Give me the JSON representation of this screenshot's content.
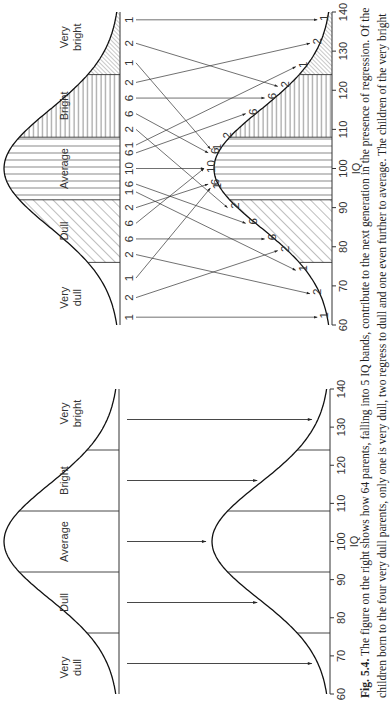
{
  "figure": {
    "number_label": "Fig. 5.4.",
    "caption_line1": "The figure on the right shows how 64 parents, falling into 5 IQ bands, contribute to the next generation in the presence of regression. Of the",
    "caption_line2": "children born to the four very dull parents, only one is very dull, two regress to dull and one even further to average. The children of the very bright"
  },
  "axis": {
    "label": "IQ",
    "ticks": [
      60,
      70,
      80,
      90,
      100,
      110,
      120,
      130,
      140
    ]
  },
  "bands": [
    {
      "name": "Very dull",
      "lines": [
        "Very",
        "dull"
      ],
      "from": 60,
      "to": 76
    },
    {
      "name": "Dull",
      "lines": [
        "Dull"
      ],
      "from": 76,
      "to": 92
    },
    {
      "name": "Average",
      "lines": [
        "Average"
      ],
      "from": 92,
      "to": 108
    },
    {
      "name": "Bright",
      "lines": [
        "Bright"
      ],
      "from": 108,
      "to": 124
    },
    {
      "name": "Very bright",
      "lines": [
        "Very",
        "bright"
      ],
      "from": 124,
      "to": 140
    }
  ],
  "colors": {
    "ink": "#333333",
    "paper": "#ffffff"
  },
  "chart_data": [
    {
      "type": "diagram",
      "title": "Left figure: regression-free inheritance",
      "xlabel": "IQ",
      "xlim": [
        60,
        140
      ],
      "categories": [
        "Very dull",
        "Dull",
        "Average",
        "Bright",
        "Very bright"
      ],
      "band_boundaries": [
        76,
        92,
        108,
        124
      ],
      "parent_positions": [
        68,
        84,
        100,
        116,
        132
      ],
      "child_positions": [
        68,
        84,
        100,
        116,
        132
      ],
      "note": "Each parent band maps straight down to the same IQ in the next generation"
    },
    {
      "type": "diagram",
      "title": "Right figure: 64 parents contributing to next generation with regression",
      "xlabel": "IQ",
      "xlim": [
        60,
        140
      ],
      "categories": [
        "Very dull",
        "Dull",
        "Average",
        "Bright",
        "Very bright"
      ],
      "parent_counts_by_band": [
        4,
        16,
        24,
        16,
        4
      ],
      "parent_labels_left_to_right": [
        1,
        2,
        1,
        2,
        6,
        6,
        2,
        1,
        6,
        10,
        6,
        1,
        2,
        6,
        6,
        2,
        1,
        2,
        1
      ],
      "flows": [
        {
          "count": 1,
          "from_iq": 62,
          "to_iq": 62
        },
        {
          "count": 2,
          "from_iq": 67,
          "to_iq": 79
        },
        {
          "count": 1,
          "from_iq": 72,
          "to_iq": 95
        },
        {
          "count": 2,
          "from_iq": 78,
          "to_iq": 68
        },
        {
          "count": 6,
          "from_iq": 82,
          "to_iq": 82
        },
        {
          "count": 6,
          "from_iq": 86,
          "to_iq": 100
        },
        {
          "count": 2,
          "from_iq": 90,
          "to_iq": 96
        },
        {
          "count": 1,
          "from_iq": 94,
          "to_iq": 74
        },
        {
          "count": 6,
          "from_iq": 96,
          "to_iq": 86
        },
        {
          "count": 10,
          "from_iq": 100,
          "to_iq": 100
        },
        {
          "count": 6,
          "from_iq": 104,
          "to_iq": 114
        },
        {
          "count": 1,
          "from_iq": 106,
          "to_iq": 126
        },
        {
          "count": 2,
          "from_iq": 110,
          "to_iq": 90
        },
        {
          "count": 6,
          "from_iq": 114,
          "to_iq": 104
        },
        {
          "count": 6,
          "from_iq": 118,
          "to_iq": 118
        },
        {
          "count": 2,
          "from_iq": 122,
          "to_iq": 132
        },
        {
          "count": 1,
          "from_iq": 127,
          "to_iq": 105
        },
        {
          "count": 2,
          "from_iq": 132,
          "to_iq": 121
        },
        {
          "count": 1,
          "from_iq": 138,
          "to_iq": 138
        }
      ],
      "child_labels": [
        {
          "iq": 62,
          "label": "1"
        },
        {
          "iq": 68,
          "label": "2"
        },
        {
          "iq": 74,
          "label": "1"
        },
        {
          "iq": 79,
          "label": "2"
        },
        {
          "iq": 82,
          "label": "6"
        },
        {
          "iq": 86,
          "label": "6"
        },
        {
          "iq": 90,
          "label": "2"
        },
        {
          "iq": 95,
          "label": "1"
        },
        {
          "iq": 96,
          "label": "6"
        },
        {
          "iq": 100,
          "label": "10"
        },
        {
          "iq": 104,
          "label": "6"
        },
        {
          "iq": 105,
          "label": "1"
        },
        {
          "iq": 108,
          "label": "2"
        },
        {
          "iq": 114,
          "label": "6"
        },
        {
          "iq": 118,
          "label": "6"
        },
        {
          "iq": 121,
          "label": "2"
        },
        {
          "iq": 126,
          "label": "1"
        },
        {
          "iq": 132,
          "label": "2"
        },
        {
          "iq": 138,
          "label": "1"
        }
      ],
      "shading": {
        "Very dull": "none",
        "Dull": "diagonal",
        "Average": "vertical",
        "Bright": "horizontal",
        "Very bright": "fine-diagonal"
      }
    }
  ]
}
